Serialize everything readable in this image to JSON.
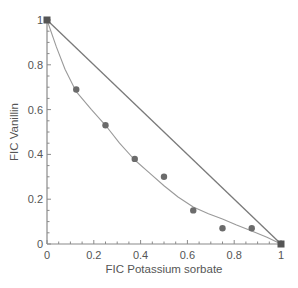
{
  "chart_data": {
    "type": "scatter",
    "title": "",
    "xlabel": "FIC Potassium sorbate",
    "ylabel": "FIC Vanillin",
    "xlim": [
      0,
      1
    ],
    "ylim": [
      0,
      1
    ],
    "grid": false,
    "x_ticks": [
      "0",
      "0.2",
      "0.4",
      "0.6",
      "0.8",
      "1"
    ],
    "y_ticks": [
      "0",
      "0.2",
      "0.4",
      "0.6",
      "0.8",
      "1"
    ],
    "series": [
      {
        "name": "Experimental isobologram points",
        "kind": "scatter",
        "marker": "circle",
        "x": [
          0.125,
          0.25,
          0.375,
          0.5,
          0.625,
          0.75,
          0.875
        ],
        "y": [
          0.69,
          0.53,
          0.38,
          0.3,
          0.15,
          0.07,
          0.07
        ]
      },
      {
        "name": "Fitted curve",
        "kind": "line",
        "x": [
          0,
          0.04,
          0.077,
          0.125,
          0.19,
          0.25,
          0.31,
          0.375,
          0.44,
          0.5,
          0.56,
          0.625,
          0.69,
          0.75,
          0.81,
          0.875,
          0.94,
          1
        ],
        "y": [
          1.0,
          0.88,
          0.78,
          0.68,
          0.6,
          0.53,
          0.45,
          0.375,
          0.315,
          0.26,
          0.21,
          0.165,
          0.135,
          0.112,
          0.085,
          0.058,
          0.03,
          0
        ]
      },
      {
        "name": "Additivity line",
        "kind": "line",
        "x": [
          0,
          1
        ],
        "y": [
          1,
          0
        ]
      },
      {
        "name": "Single-agent endpoints",
        "kind": "scatter",
        "marker": "square",
        "x": [
          0,
          1
        ],
        "y": [
          1,
          0
        ]
      }
    ],
    "colors": {
      "points": "#6b6b6b",
      "curve": "#9a9a9a",
      "straight_line": "#7a7a7a",
      "axes": "#8a8a8a",
      "text": "#555555"
    }
  }
}
